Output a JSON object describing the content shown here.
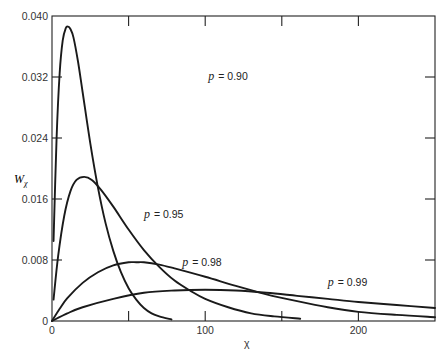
{
  "chart_data": {
    "type": "line",
    "title": "",
    "xlabel": "χ",
    "ylabel": "W_χ",
    "xlim": [
      0,
      250
    ],
    "ylim": [
      0,
      0.04
    ],
    "grid": false,
    "legend_position": "inline labels",
    "x_ticks": [
      0,
      50,
      100,
      150,
      200
    ],
    "x_tick_labels": [
      "0",
      "",
      "100",
      "",
      "200"
    ],
    "y_ticks": [
      0,
      0.008,
      0.016,
      0.024,
      0.032,
      0.04
    ],
    "y_tick_labels": [
      "0",
      "0.008",
      "0.016",
      "0.024",
      "0.032",
      "0.040"
    ],
    "series": [
      {
        "name": "p = 0.90",
        "label_pos": {
          "x": 102,
          "y": 0.0316
        },
        "x": [
          1,
          3,
          5,
          7,
          9,
          10.5,
          12,
          14,
          17,
          20,
          25,
          30,
          35,
          40,
          45,
          50,
          55,
          60,
          65,
          70,
          78
        ],
        "y": [
          0.0105,
          0.024,
          0.0325,
          0.0368,
          0.0384,
          0.0386,
          0.0383,
          0.0372,
          0.034,
          0.03,
          0.0233,
          0.0175,
          0.0128,
          0.0092,
          0.0064,
          0.0043,
          0.0028,
          0.0017,
          0.001,
          0.0006,
          0.0002
        ]
      },
      {
        "name": "p = 0.95",
        "label_pos": {
          "x": 60,
          "y": 0.0135
        },
        "x": [
          1,
          4,
          8,
          12,
          16,
          21,
          26,
          32,
          40,
          50,
          60,
          70,
          80,
          90,
          100,
          115,
          130,
          145,
          162
        ],
        "y": [
          0.0028,
          0.0085,
          0.0138,
          0.017,
          0.0185,
          0.0189,
          0.0185,
          0.0172,
          0.015,
          0.012,
          0.0093,
          0.0071,
          0.0053,
          0.004,
          0.0029,
          0.0018,
          0.001,
          0.0006,
          0.0003
        ]
      },
      {
        "name": "p = 0.98",
        "label_pos": {
          "x": 85,
          "y": 0.0072
        },
        "x": [
          0,
          5,
          10,
          20,
          30,
          40,
          50,
          55,
          60,
          70,
          80,
          100,
          120,
          140,
          160,
          180,
          200,
          225,
          250
        ],
        "y": [
          0,
          0.0016,
          0.003,
          0.005,
          0.0064,
          0.0073,
          0.0077,
          0.0077,
          0.0077,
          0.0074,
          0.0069,
          0.0058,
          0.0046,
          0.0035,
          0.0026,
          0.0018,
          0.0012,
          0.0008,
          0.0005
        ]
      },
      {
        "name": "p = 0.99",
        "label_pos": {
          "x": 180,
          "y": 0.0046
        },
        "x": [
          0,
          10,
          20,
          40,
          60,
          80,
          100,
          120,
          140,
          160,
          180,
          200,
          225,
          250
        ],
        "y": [
          0,
          0.001,
          0.0018,
          0.0029,
          0.0037,
          0.004,
          0.0041,
          0.004,
          0.0037,
          0.0033,
          0.0029,
          0.0025,
          0.0021,
          0.0017
        ]
      }
    ]
  },
  "labels": {
    "ylabel_main": "W",
    "ylabel_sub": "χ",
    "xlabel": "χ",
    "p_symbol": "p",
    "curve_values": [
      "= 0.90",
      "= 0.95",
      "= 0.98",
      "= 0.99"
    ]
  }
}
